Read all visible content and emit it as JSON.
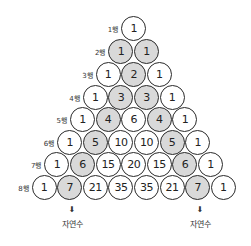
{
  "rows": [
    {
      "label": "1행",
      "values": [
        "1"
      ],
      "shaded": [
        false
      ]
    },
    {
      "label": "2행",
      "values": [
        "1",
        "1"
      ],
      "shaded": [
        true,
        true
      ]
    },
    {
      "label": "3행",
      "values": [
        "1",
        "2",
        "1"
      ],
      "shaded": [
        false,
        true,
        false
      ]
    },
    {
      "label": "4행",
      "values": [
        "1",
        "3",
        "3",
        "1"
      ],
      "shaded": [
        false,
        true,
        true,
        false
      ]
    },
    {
      "label": "5행",
      "values": [
        "1",
        "4",
        "6",
        "4",
        "1"
      ],
      "shaded": [
        false,
        true,
        false,
        true,
        false
      ]
    },
    {
      "label": "6행",
      "values": [
        "1",
        "5",
        "10",
        "10",
        "5",
        "1"
      ],
      "shaded": [
        false,
        true,
        false,
        false,
        true,
        false
      ]
    },
    {
      "label": "7행",
      "values": [
        "1",
        "6",
        "15",
        "20",
        "15",
        "6",
        "1"
      ],
      "shaded": [
        false,
        true,
        false,
        false,
        false,
        true,
        false
      ]
    },
    {
      "label": "8행",
      "values": [
        "1",
        "7",
        "21",
        "35",
        "35",
        "21",
        "7",
        "1"
      ],
      "shaded": [
        false,
        true,
        false,
        false,
        false,
        false,
        true,
        false
      ]
    }
  ],
  "annotations": [
    {
      "arrow": "⬇",
      "text": "자연수",
      "x": 72
    },
    {
      "arrow": "⬇",
      "text": "자연수",
      "x": 200
    }
  ],
  "colors": {
    "shaded": "#d9d9d9",
    "stroke": "#2a2a2a",
    "background": "#ffffff"
  }
}
